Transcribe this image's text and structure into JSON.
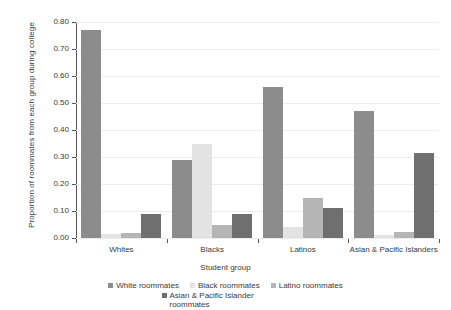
{
  "chart_data": {
    "type": "bar",
    "title": "",
    "subtitle": "",
    "xlabel": "Student group",
    "ylabel": "Proportion of roommates from each group during college",
    "categories": [
      "Whites",
      "Blacks",
      "Latinos",
      "Asian & Pacific Islanders"
    ],
    "ylim": [
      0.0,
      0.8
    ],
    "ytick_labels": [
      "0.00",
      "0.10",
      "0.20",
      "0.30",
      "0.40",
      "0.50",
      "0.60",
      "0.70",
      "0.80"
    ],
    "ytick_values": [
      0.0,
      0.1,
      0.2,
      0.3,
      0.4,
      0.5,
      0.6,
      0.7,
      0.8
    ],
    "grid": true,
    "legend_position": "bottom",
    "series": [
      {
        "name": "White roommates",
        "color": "#8c8c8c",
        "values": [
          0.77,
          0.29,
          0.56,
          0.47
        ]
      },
      {
        "name": "Black roommates",
        "color": "#e3e3e3",
        "values": [
          0.015,
          0.35,
          0.04,
          0.012
        ]
      },
      {
        "name": "Latino roommates",
        "color": "#b5b5b5",
        "values": [
          0.018,
          0.05,
          0.15,
          0.022
        ]
      },
      {
        "name": "Asian & Pacific Islander roommates",
        "color": "#6f6f6f",
        "values": [
          0.09,
          0.09,
          0.11,
          0.315
        ]
      }
    ]
  },
  "axes": {
    "y_title": "Proportion of roommates from each group during college",
    "x_title": "Student group"
  },
  "legend": {
    "items": [
      "White roommates",
      "Black roommates",
      "Latino roommates",
      "Asian & Pacific Islander roommates"
    ]
  },
  "colors": {
    "grid": "#ececec",
    "axis": "#555555",
    "text": "#3a3a3a",
    "background": "#ffffff"
  }
}
